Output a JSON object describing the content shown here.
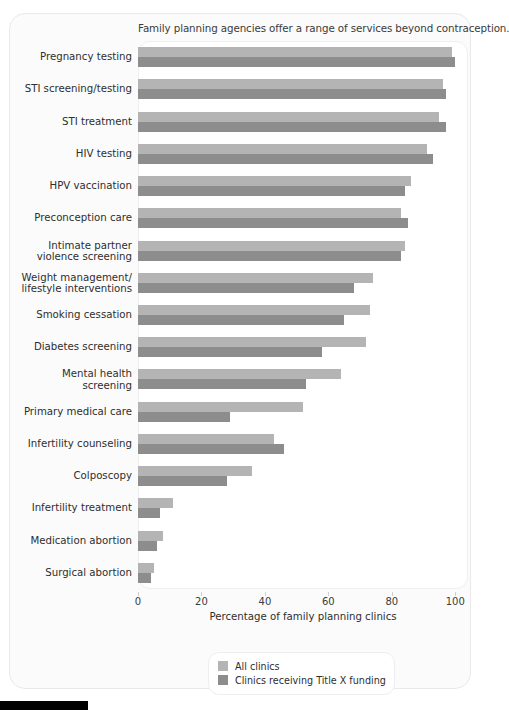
{
  "chart_data": {
    "type": "bar",
    "orientation": "horizontal",
    "title": "Family planning agencies offer a range of services beyond contraception.",
    "xlabel": "Percentage of family planning clinics",
    "ylabel": "",
    "xlim": [
      0,
      104
    ],
    "xticks": [
      0,
      20,
      40,
      60,
      80,
      100
    ],
    "xtick_labels": [
      "0",
      "20",
      "40",
      "60",
      "80",
      "100"
    ],
    "grid": false,
    "legend_position": "bottom-center",
    "categories": [
      "Pregnancy testing",
      "STI screening/testing",
      "STI treatment",
      "HIV testing",
      "HPV vaccination",
      "Preconception care",
      "Intimate partner\nviolence screening",
      "Weight management/\nlifestyle interventions",
      "Smoking cessation",
      "Diabetes screening",
      "Mental health\nscreening",
      "Primary medical care",
      "Infertility counseling",
      "Colposcopy",
      "Infertility treatment",
      "Medication abortion",
      "Surgical abortion"
    ],
    "series": [
      {
        "name": "All clinics",
        "color": "#b4b4b4",
        "values": [
          99,
          96,
          95,
          91,
          86,
          83,
          84,
          74,
          73,
          72,
          64,
          52,
          43,
          36,
          11,
          8,
          5
        ]
      },
      {
        "name": "Clinics receiving Title X funding",
        "color": "#8d8d8d",
        "values": [
          100,
          97,
          97,
          93,
          84,
          85,
          83,
          68,
          65,
          58,
          53,
          29,
          46,
          28,
          7,
          6,
          4
        ]
      }
    ]
  },
  "legend": {
    "items": [
      {
        "label": "All clinics",
        "color": "#b4b4b4"
      },
      {
        "label": "Clinics receiving Title X funding",
        "color": "#8d8d8d"
      }
    ]
  }
}
